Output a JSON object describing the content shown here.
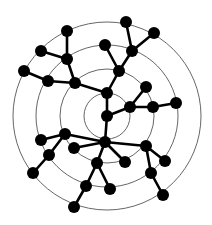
{
  "diagram": {
    "type": "radial-tree",
    "background": "#ffffff",
    "node_color": "#000000",
    "edge_color": "#000000",
    "ring_color": "#555555",
    "center": [
      107,
      116
    ],
    "rings": [
      23,
      47,
      71,
      94
    ],
    "node_radius": 6,
    "nodes": [
      {
        "id": 0,
        "x": 107,
        "y": 116
      },
      {
        "id": 1,
        "x": 107,
        "y": 93
      },
      {
        "id": 2,
        "x": 130,
        "y": 107
      },
      {
        "id": 3,
        "x": 146,
        "y": 87
      },
      {
        "id": 4,
        "x": 153,
        "y": 107
      },
      {
        "id": 5,
        "x": 176,
        "y": 103
      },
      {
        "id": 6,
        "x": 119,
        "y": 71
      },
      {
        "id": 7,
        "x": 105,
        "y": 45
      },
      {
        "id": 8,
        "x": 132,
        "y": 51
      },
      {
        "id": 9,
        "x": 126,
        "y": 22
      },
      {
        "id": 10,
        "x": 154,
        "y": 33
      },
      {
        "id": 11,
        "x": 75,
        "y": 83
      },
      {
        "id": 12,
        "x": 48,
        "y": 81
      },
      {
        "id": 13,
        "x": 24,
        "y": 71
      },
      {
        "id": 14,
        "x": 67,
        "y": 59
      },
      {
        "id": 15,
        "x": 41,
        "y": 51
      },
      {
        "id": 16,
        "x": 67,
        "y": 31
      },
      {
        "id": 17,
        "x": 105,
        "y": 142
      },
      {
        "id": 18,
        "x": 65,
        "y": 134
      },
      {
        "id": 19,
        "x": 41,
        "y": 140
      },
      {
        "id": 20,
        "x": 49,
        "y": 155
      },
      {
        "id": 21,
        "x": 33,
        "y": 173
      },
      {
        "id": 22,
        "x": 74,
        "y": 148
      },
      {
        "id": 23,
        "x": 97,
        "y": 163
      },
      {
        "id": 24,
        "x": 86,
        "y": 186
      },
      {
        "id": 25,
        "x": 74,
        "y": 207
      },
      {
        "id": 26,
        "x": 110,
        "y": 189
      },
      {
        "id": 27,
        "x": 125,
        "y": 162
      },
      {
        "id": 28,
        "x": 146,
        "y": 146
      },
      {
        "id": 29,
        "x": 165,
        "y": 161
      },
      {
        "id": 30,
        "x": 151,
        "y": 173
      },
      {
        "id": 31,
        "x": 163,
        "y": 195
      }
    ],
    "edges": [
      [
        0,
        1
      ],
      [
        0,
        2
      ],
      [
        0,
        17
      ],
      [
        2,
        3
      ],
      [
        2,
        4
      ],
      [
        4,
        5
      ],
      [
        1,
        6
      ],
      [
        6,
        7
      ],
      [
        6,
        8
      ],
      [
        8,
        9
      ],
      [
        8,
        10
      ],
      [
        1,
        11
      ],
      [
        11,
        12
      ],
      [
        12,
        13
      ],
      [
        11,
        14
      ],
      [
        14,
        15
      ],
      [
        14,
        16
      ],
      [
        17,
        18
      ],
      [
        18,
        19
      ],
      [
        18,
        20
      ],
      [
        20,
        21
      ],
      [
        17,
        22
      ],
      [
        17,
        23
      ],
      [
        23,
        24
      ],
      [
        24,
        25
      ],
      [
        23,
        26
      ],
      [
        17,
        27
      ],
      [
        17,
        28
      ],
      [
        28,
        29
      ],
      [
        28,
        30
      ],
      [
        30,
        31
      ]
    ]
  }
}
